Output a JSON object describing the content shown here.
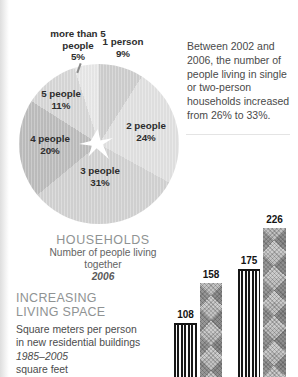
{
  "annotation": {
    "text": "Between 2002 and 2006, the number of people living in single or two-person households increased from 26% to 33%."
  },
  "pie_section": {
    "title": "HOUSEHOLDS",
    "subtitle_lines": [
      "Number of people living",
      "together"
    ],
    "year": "2006",
    "labels": [
      {
        "name": "1 person",
        "pct": "9%"
      },
      {
        "name": "2 people",
        "pct": "24%"
      },
      {
        "name": "3 people",
        "pct": "31%"
      },
      {
        "name": "4 people",
        "pct": "20%"
      },
      {
        "name": "5 people",
        "pct": "11%"
      },
      {
        "name": "more than 5 people",
        "pct": "5%"
      }
    ]
  },
  "bar_section": {
    "title_lines": [
      "INCREASING",
      "LIVING SPACE"
    ],
    "subtitle_lines": [
      "Square meters per person",
      "in new residential buildings"
    ],
    "period": "1985–2005",
    "unit": "square feet"
  },
  "chart_data": [
    {
      "type": "pie",
      "title": "HOUSEHOLDS",
      "subtitle": "Number of people living together",
      "year": "2006",
      "labels": [
        "1 person",
        "2 people",
        "3 people",
        "4 people",
        "5 people",
        "more than 5 people"
      ],
      "values": [
        9,
        24,
        31,
        20,
        11,
        5
      ],
      "unit": "percent",
      "start_angle_deg": 0,
      "direction": "clockwise",
      "colors": [
        "#cfcfcf",
        "#e2e2e2",
        "#d3d3d3",
        "#bebebe",
        "#d8d8d8",
        "#e9e9e9"
      ],
      "center_icon": "white starburst"
    },
    {
      "type": "bar",
      "title": "INCREASING LIVING SPACE",
      "subtitle": "Square meters per person in new residential buildings",
      "period": "1985–2005",
      "unit": "square feet",
      "values": [
        108,
        158,
        175,
        226
      ],
      "bar_patterns": [
        "vertical-stripes",
        "diamond-weave",
        "vertical-stripes",
        "diamond-weave"
      ],
      "baseline_cut_off": true
    }
  ]
}
